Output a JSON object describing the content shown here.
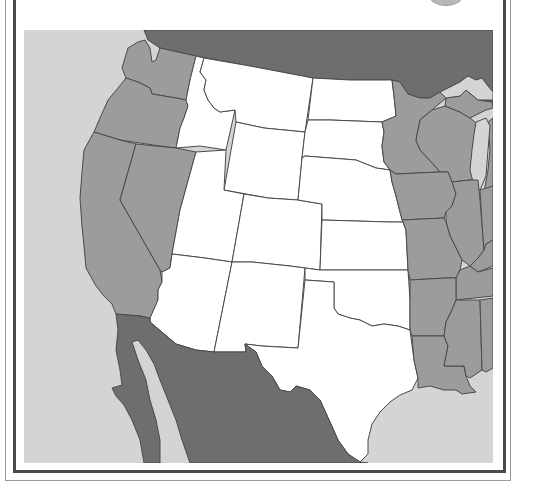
{
  "map": {
    "title": "",
    "region": "Western United States",
    "colors": {
      "ocean": "#d4d4d4",
      "highlighted_states": "#ffffff",
      "other_us_states": "#9c9c9c",
      "foreign_countries": "#6e6e6e",
      "lakes": "#d4d4d4",
      "border": "#4a4a4a",
      "frame_dark": "#4a4a4a",
      "frame_light": "#9a9a9a"
    },
    "highlighted_states": [
      "Montana",
      "Idaho",
      "Wyoming",
      "Utah",
      "Colorado",
      "Arizona",
      "New Mexico",
      "North Dakota",
      "South Dakota",
      "Nebraska",
      "Kansas",
      "Oklahoma",
      "Texas"
    ],
    "shaded_states": [
      "Washington",
      "Oregon",
      "California",
      "Nevada",
      "Minnesota",
      "Wisconsin",
      "Michigan",
      "Iowa",
      "Illinois",
      "Indiana",
      "Missouri",
      "Arkansas",
      "Louisiana",
      "Mississippi",
      "Alabama",
      "Tennessee",
      "Kentucky"
    ],
    "foreign_regions": [
      "Canada",
      "Mexico"
    ],
    "labels_visible": false
  }
}
